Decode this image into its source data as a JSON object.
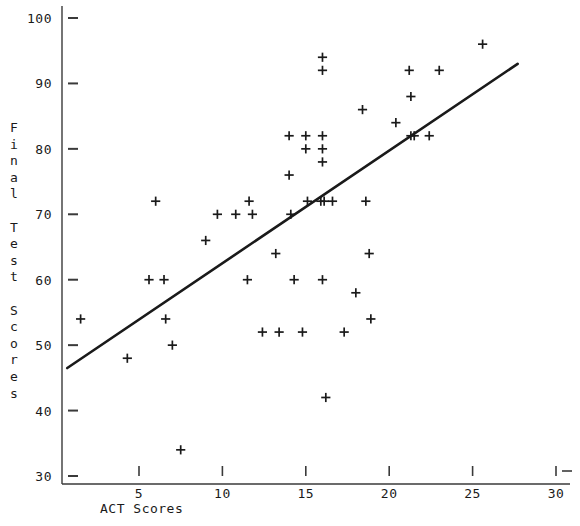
{
  "chart_data": {
    "type": "scatter",
    "title": "",
    "xlabel": "ACT Scores",
    "ylabel": "Final Test Scores",
    "xlim": [
      0,
      31
    ],
    "ylim": [
      28,
      101
    ],
    "grid": false,
    "legend": "none",
    "marker": "+",
    "marker_color": "#1a1a1a",
    "x_ticks": [
      5,
      10,
      15,
      20,
      25,
      30
    ],
    "x_tick_labels": [
      "5",
      "10",
      "15",
      "20",
      "25",
      "30"
    ],
    "y_ticks": [
      30,
      40,
      50,
      60,
      70,
      80,
      90,
      100
    ],
    "y_tick_labels": [
      "30",
      "40",
      "50",
      "60",
      "70",
      "80",
      "90",
      "100"
    ],
    "points": [
      {
        "x": 1.5,
        "y": 54
      },
      {
        "x": 4.3,
        "y": 48
      },
      {
        "x": 6.0,
        "y": 72
      },
      {
        "x": 5.6,
        "y": 60
      },
      {
        "x": 6.5,
        "y": 60
      },
      {
        "x": 6.6,
        "y": 54
      },
      {
        "x": 7.0,
        "y": 50
      },
      {
        "x": 7.5,
        "y": 34
      },
      {
        "x": 9.0,
        "y": 66
      },
      {
        "x": 9.7,
        "y": 70
      },
      {
        "x": 10.8,
        "y": 70
      },
      {
        "x": 11.8,
        "y": 70
      },
      {
        "x": 11.6,
        "y": 72
      },
      {
        "x": 11.5,
        "y": 60
      },
      {
        "x": 12.4,
        "y": 52
      },
      {
        "x": 13.2,
        "y": 64
      },
      {
        "x": 13.4,
        "y": 52
      },
      {
        "x": 14.0,
        "y": 82
      },
      {
        "x": 14.0,
        "y": 76
      },
      {
        "x": 14.1,
        "y": 70
      },
      {
        "x": 14.3,
        "y": 60
      },
      {
        "x": 15.0,
        "y": 82
      },
      {
        "x": 15.0,
        "y": 80
      },
      {
        "x": 15.1,
        "y": 72
      },
      {
        "x": 14.8,
        "y": 52
      },
      {
        "x": 16.0,
        "y": 94
      },
      {
        "x": 16.0,
        "y": 92
      },
      {
        "x": 16.0,
        "y": 82
      },
      {
        "x": 16.0,
        "y": 80
      },
      {
        "x": 16.0,
        "y": 78
      },
      {
        "x": 15.9,
        "y": 72
      },
      {
        "x": 16.1,
        "y": 72
      },
      {
        "x": 16.0,
        "y": 60
      },
      {
        "x": 16.2,
        "y": 42
      },
      {
        "x": 16.6,
        "y": 72
      },
      {
        "x": 17.3,
        "y": 52
      },
      {
        "x": 18.0,
        "y": 58
      },
      {
        "x": 18.4,
        "y": 86
      },
      {
        "x": 18.6,
        "y": 72
      },
      {
        "x": 18.8,
        "y": 64
      },
      {
        "x": 18.9,
        "y": 54
      },
      {
        "x": 20.4,
        "y": 84
      },
      {
        "x": 21.2,
        "y": 92
      },
      {
        "x": 21.3,
        "y": 88
      },
      {
        "x": 21.3,
        "y": 82
      },
      {
        "x": 21.5,
        "y": 82
      },
      {
        "x": 22.4,
        "y": 82
      },
      {
        "x": 23.0,
        "y": 92
      },
      {
        "x": 25.6,
        "y": 96
      }
    ],
    "trendline": {
      "label": "least-squares regression line",
      "x_start": 0.7,
      "y_start": 46.5,
      "x_end": 27.7,
      "y_end": 93,
      "color": "#1a1a1a",
      "width": 2.6
    },
    "axes": {
      "color": "#3a3a3a",
      "y_axis_x": 62,
      "x_axis_y": 484,
      "y_axis_top": 6,
      "x_axis_right": 570
    }
  }
}
